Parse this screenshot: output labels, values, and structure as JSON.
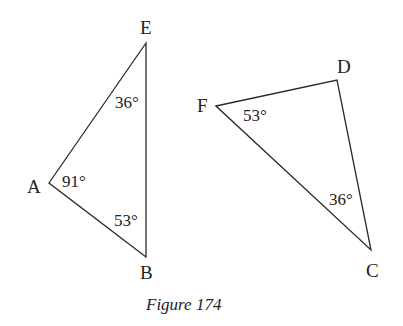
{
  "figure": {
    "caption": "Figure 174",
    "colors": {
      "stroke": "#2a2a2a",
      "text": "#222222",
      "background": "#ffffff"
    },
    "triangles": [
      {
        "name": "ABE",
        "vertices": {
          "E": {
            "label": "E",
            "x": 146,
            "y": 43
          },
          "A": {
            "label": "A",
            "x": 49,
            "y": 183
          },
          "B": {
            "label": "B",
            "x": 146,
            "y": 257
          }
        },
        "angles": {
          "E": "36°",
          "A": "91°",
          "B": "53°"
        }
      },
      {
        "name": "CDF",
        "vertices": {
          "F": {
            "label": "F",
            "x": 216,
            "y": 106
          },
          "D": {
            "label": "D",
            "x": 337,
            "y": 80
          },
          "C": {
            "label": "C",
            "x": 371,
            "y": 250
          }
        },
        "angles": {
          "F": "53°",
          "C": "36°"
        }
      }
    ]
  }
}
